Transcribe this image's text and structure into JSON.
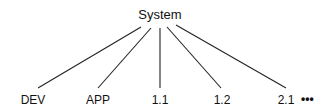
{
  "diagram": {
    "type": "tree",
    "root": {
      "label": "System"
    },
    "children": [
      {
        "label": "DEV"
      },
      {
        "label": "APP"
      },
      {
        "label": "1.1"
      },
      {
        "label": "1.2"
      },
      {
        "label": "2.1"
      }
    ],
    "continuation": "•••",
    "colors": {
      "line": "#222222",
      "text": "#111111",
      "background": "#ffffff"
    }
  }
}
